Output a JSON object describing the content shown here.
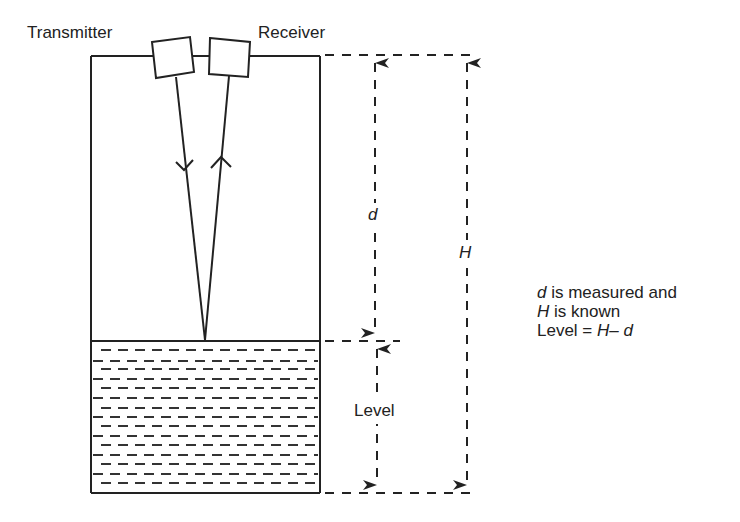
{
  "diagram": {
    "labels": {
      "transmitter": "Transmitter",
      "receiver": "Receiver",
      "distance_symbol": "d",
      "height_symbol": "H",
      "level": "Level"
    },
    "note": {
      "line1_symbol": "d",
      "line1_text": " is measured and",
      "line2_symbol": "H",
      "line2_text": " is known",
      "line3_text": "Level = ",
      "line3_formula": "H– d"
    },
    "colors": {
      "stroke": "#222222",
      "background": "#ffffff"
    }
  }
}
